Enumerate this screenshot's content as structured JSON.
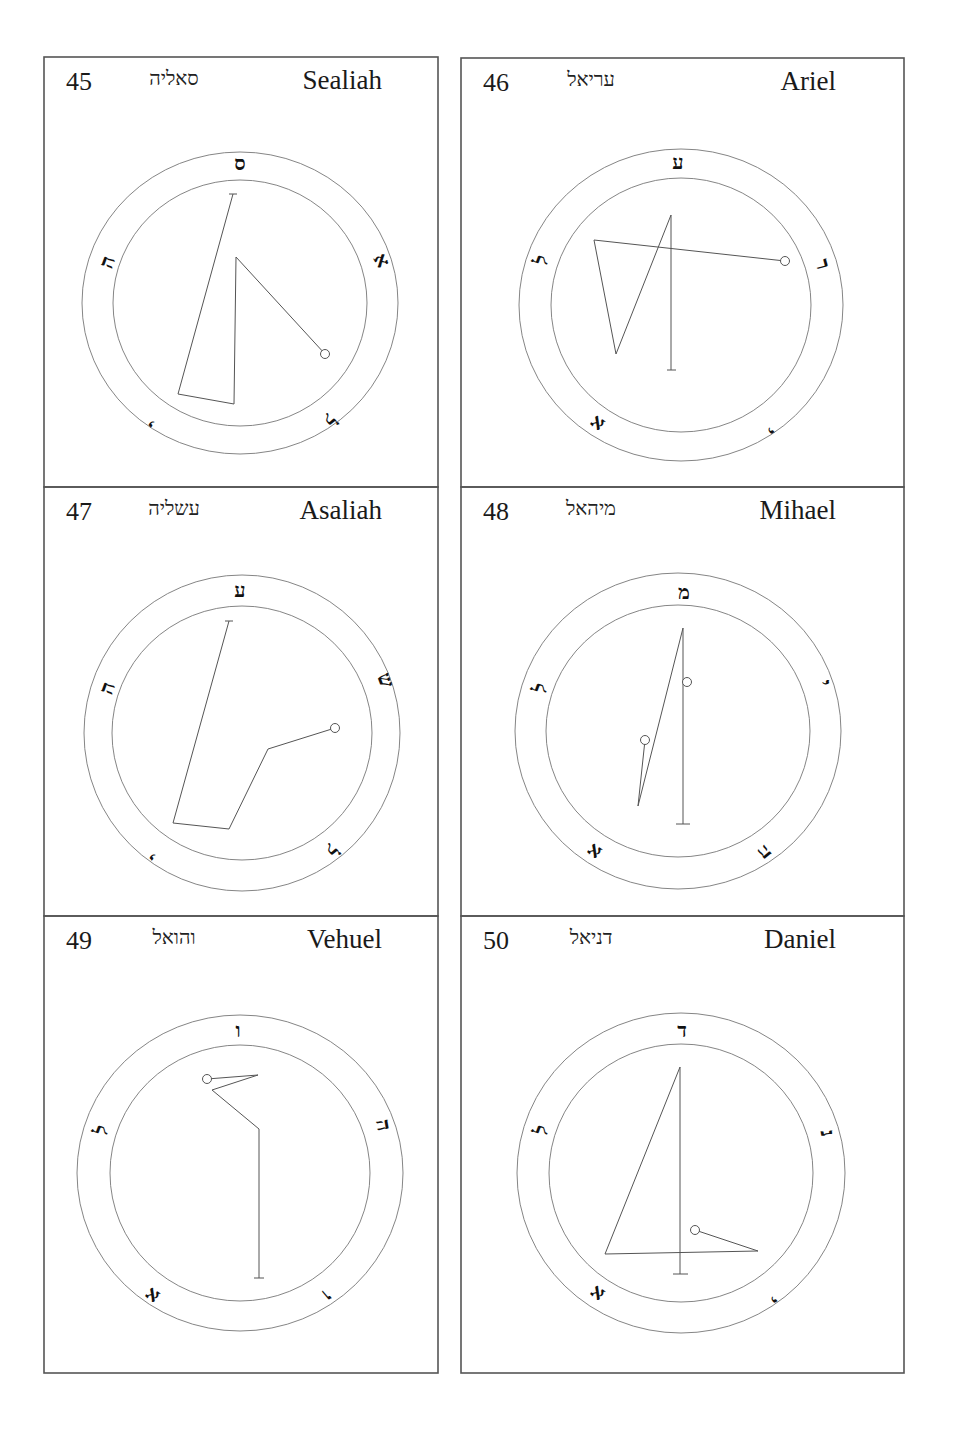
{
  "panels": [
    {
      "number": "45",
      "hebrew": "סאליה",
      "name": "Sealiah",
      "frame": [
        44,
        57,
        394,
        430
      ],
      "center": [
        240,
        303
      ],
      "outer": [
        158,
        151
      ],
      "inner": [
        127,
        123
      ],
      "letters": [
        {
          "char": "ס",
          "x": 240,
          "y": 163,
          "rot": 0
        },
        {
          "char": "א",
          "x": 382,
          "y": 260,
          "rot": 60
        },
        {
          "char": "ל",
          "x": 330,
          "y": 420,
          "rot": 140
        },
        {
          "char": "י",
          "x": 152,
          "y": 423,
          "rot": 220
        },
        {
          "char": "ה",
          "x": 107,
          "y": 262,
          "rot": 290
        }
      ],
      "path": [
        [
          233,
          194
        ],
        [
          178,
          394
        ],
        [
          234,
          404
        ],
        [
          236,
          257
        ],
        [
          325,
          354
        ]
      ],
      "bars": [
        [
          [
            229,
            194
          ],
          [
            237,
            194
          ]
        ]
      ],
      "dots": [
        [
          325,
          354
        ]
      ]
    },
    {
      "number": "46",
      "hebrew": "עריאל",
      "name": "Ariel",
      "frame": [
        461,
        58,
        443,
        429
      ],
      "center": [
        681,
        305
      ],
      "outer": [
        162,
        156
      ],
      "inner": [
        130,
        127
      ],
      "letters": [
        {
          "char": "ע",
          "x": 678,
          "y": 162,
          "rot": 0
        },
        {
          "char": "ר",
          "x": 823,
          "y": 264,
          "rot": 75
        },
        {
          "char": "י",
          "x": 770,
          "y": 430,
          "rot": 140
        },
        {
          "char": "א",
          "x": 597,
          "y": 424,
          "rot": 215
        },
        {
          "char": "ל",
          "x": 541,
          "y": 260,
          "rot": 290
        }
      ],
      "path": [
        [
          785,
          261
        ],
        [
          594,
          240
        ],
        [
          616,
          354
        ],
        [
          671,
          215
        ],
        [
          671,
          370
        ]
      ],
      "bars": [
        [
          [
            667,
            370
          ],
          [
            676,
            370
          ]
        ]
      ],
      "dots": [
        [
          785,
          261
        ]
      ]
    },
    {
      "number": "47",
      "hebrew": "עשליה",
      "name": "Asaliah",
      "frame": [
        44,
        487,
        394,
        429
      ],
      "center": [
        242,
        733
      ],
      "outer": [
        158,
        158
      ],
      "inner": [
        130,
        127
      ],
      "letters": [
        {
          "char": "ע",
          "x": 240,
          "y": 590,
          "rot": 0
        },
        {
          "char": "ש",
          "x": 386,
          "y": 680,
          "rot": 70
        },
        {
          "char": "ל",
          "x": 332,
          "y": 850,
          "rot": 140
        },
        {
          "char": "י",
          "x": 153,
          "y": 856,
          "rot": 220
        },
        {
          "char": "ה",
          "x": 107,
          "y": 688,
          "rot": 290
        }
      ],
      "path": [
        [
          229,
          621
        ],
        [
          173,
          823
        ],
        [
          229,
          829
        ],
        [
          268,
          749
        ],
        [
          335,
          728
        ]
      ],
      "bars": [
        [
          [
            225,
            621
          ],
          [
            233,
            621
          ]
        ]
      ],
      "dots": [
        [
          335,
          728
        ]
      ]
    },
    {
      "number": "48",
      "hebrew": "מיהאל",
      "name": "Mihael",
      "frame": [
        461,
        487,
        443,
        429
      ],
      "center": [
        678,
        731
      ],
      "outer": [
        163,
        158
      ],
      "inner": [
        132,
        126
      ],
      "letters": [
        {
          "char": "מ",
          "x": 684,
          "y": 592,
          "rot": 0
        },
        {
          "char": "י",
          "x": 825,
          "y": 683,
          "rot": 75
        },
        {
          "char": "ה",
          "x": 765,
          "y": 853,
          "rot": 140
        },
        {
          "char": "א",
          "x": 594,
          "y": 852,
          "rot": 215
        },
        {
          "char": "ל",
          "x": 540,
          "y": 688,
          "rot": 290
        }
      ],
      "path": [
        [
          645,
          740
        ],
        [
          638,
          806
        ],
        [
          683,
          628
        ],
        [
          683,
          824
        ]
      ],
      "bars": [
        [
          [
            676,
            824
          ],
          [
            690,
            824
          ]
        ]
      ],
      "dots": [
        [
          645,
          740
        ],
        [
          687,
          682
        ]
      ]
    },
    {
      "number": "49",
      "hebrew": "והואל",
      "name": "Vehuel",
      "frame": [
        44,
        916,
        394,
        457
      ],
      "center": [
        240,
        1173
      ],
      "outer": [
        163,
        158
      ],
      "inner": [
        130,
        128
      ],
      "letters": [
        {
          "char": "ו",
          "x": 238,
          "y": 1030,
          "rot": 0
        },
        {
          "char": "ה",
          "x": 384,
          "y": 1125,
          "rot": 80
        },
        {
          "char": "ו",
          "x": 327,
          "y": 1296,
          "rot": 140
        },
        {
          "char": "א",
          "x": 152,
          "y": 1296,
          "rot": 215
        },
        {
          "char": "ל",
          "x": 101,
          "y": 1130,
          "rot": 290
        }
      ],
      "path": [
        [
          207,
          1079
        ],
        [
          258,
          1075
        ],
        [
          212,
          1090
        ],
        [
          259,
          1129
        ],
        [
          259,
          1278
        ]
      ],
      "bars": [
        [
          [
            254,
            1278
          ],
          [
            264,
            1278
          ]
        ]
      ],
      "dots": [
        [
          207,
          1079
        ]
      ]
    },
    {
      "number": "50",
      "hebrew": "דניאל",
      "name": "Daniel",
      "frame": [
        461,
        916,
        443,
        457
      ],
      "center": [
        681,
        1173
      ],
      "outer": [
        164,
        160
      ],
      "inner": [
        132,
        129
      ],
      "letters": [
        {
          "char": "ד",
          "x": 682,
          "y": 1030,
          "rot": 0
        },
        {
          "char": "נ",
          "x": 828,
          "y": 1133,
          "rot": 80
        },
        {
          "char": "י",
          "x": 773,
          "y": 1299,
          "rot": 140
        },
        {
          "char": "א",
          "x": 597,
          "y": 1294,
          "rot": 215
        },
        {
          "char": "ל",
          "x": 541,
          "y": 1130,
          "rot": 290
        }
      ],
      "path": [
        [
          695,
          1230
        ],
        [
          758,
          1251
        ],
        [
          605,
          1254
        ],
        [
          680,
          1067
        ],
        [
          680,
          1274
        ]
      ],
      "bars": [
        [
          [
            673,
            1274
          ],
          [
            688,
            1274
          ]
        ]
      ],
      "dots": [
        [
          695,
          1230
        ]
      ]
    }
  ],
  "colors": {
    "frame": "#555555",
    "ring": "#777777",
    "sigil": "#555555",
    "text": "#1a1a1a"
  }
}
